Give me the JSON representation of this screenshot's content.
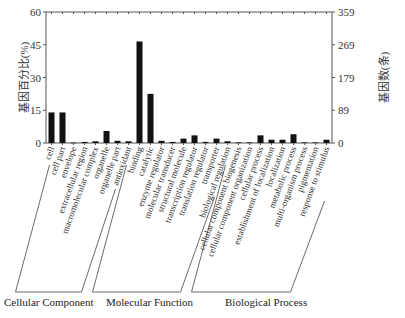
{
  "chart_data": {
    "type": "bar",
    "title": "",
    "xlabel": "",
    "ylabel": "基因百分比(%)",
    "ylabel_right": "基因数(条)",
    "ylim": [
      0,
      60
    ],
    "yticks": [
      0,
      15,
      30,
      45,
      60
    ],
    "yticks_right": [
      0,
      89,
      179,
      269,
      359
    ],
    "grid": false,
    "legend": null,
    "bar_color": "#111111",
    "categories": [
      "cell",
      "cell part",
      "envelope",
      "extracellular region",
      "macromolecular complex",
      "organelle",
      "organelle part",
      "antioxidant",
      "binding",
      "catalytic",
      "enzyme regulator",
      "molecular transducer",
      "structural molecule",
      "transcription regulator",
      "translation regulator",
      "transporter",
      "biological regulation",
      "cellular component biogenesis",
      "cellular component organization",
      "cellular process",
      "establishment of localization",
      "localization",
      "metabolic process",
      "multi-organism process",
      "pigmentation",
      "response to stimulus"
    ],
    "values": [
      14,
      14,
      0.2,
      0.5,
      0.8,
      5.5,
      1.0,
      0.8,
      46.5,
      22.5,
      1.0,
      0.5,
      2.0,
      3.5,
      0.5,
      2.0,
      0.8,
      0.3,
      0.3,
      3.5,
      1.5,
      1.5,
      4.0,
      0.3,
      0.3,
      1.5
    ],
    "groups": [
      {
        "name": "Cellular Component",
        "start": 0,
        "end": 6
      },
      {
        "name": "Molecular Function",
        "start": 7,
        "end": 15
      },
      {
        "name": "Biological Process",
        "start": 16,
        "end": 25
      }
    ]
  }
}
